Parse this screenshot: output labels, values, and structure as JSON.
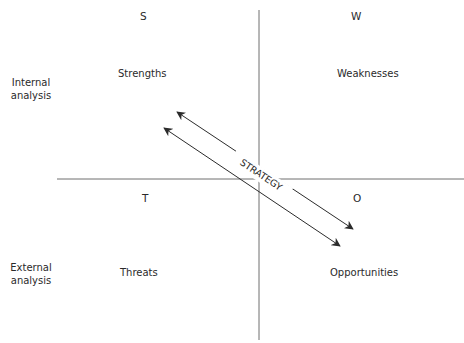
{
  "diagram": {
    "type": "swot-matrix",
    "quadrants": {
      "s": {
        "letter": "S",
        "label": "Strengths"
      },
      "w": {
        "letter": "W",
        "label": "Weaknesses"
      },
      "t": {
        "letter": "T",
        "label": "Threats"
      },
      "o": {
        "letter": "O",
        "label": "Opportunities"
      }
    },
    "rows": {
      "internal": {
        "line1": "Internal",
        "line2": "analysis"
      },
      "external": {
        "line1": "External",
        "line2": "analysis"
      }
    },
    "center_label": "STRATEGY",
    "colors": {
      "line": "#6e6e6e",
      "arrow": "#2b2b2b",
      "text": "#2a2a2a"
    }
  }
}
